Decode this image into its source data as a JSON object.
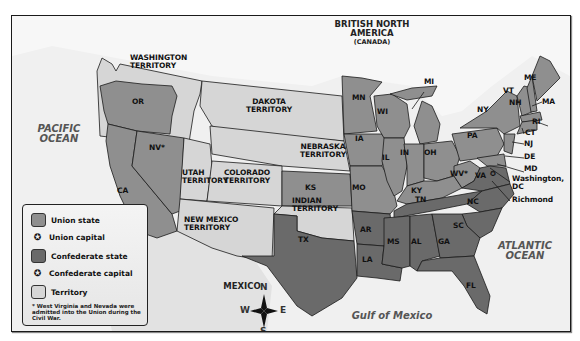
{
  "colors": {
    "union_state": "#8f8f8f",
    "confederate_state": "#6a6a6a",
    "territory": "#d6d6d6",
    "ocean": "#f0f0f0",
    "land_foreign": "#e4e4e4",
    "border": "#1a1a1a"
  },
  "regions": {
    "british_north_america": "BRITISH NORTH AMERICA",
    "canada": "(CANADA)",
    "pacific_ocean_1": "PACIFIC",
    "pacific_ocean_2": "OCEAN",
    "atlantic_ocean_1": "ATLANTIC",
    "atlantic_ocean_2": "OCEAN",
    "gulf_of_mexico": "Gulf of Mexico",
    "mexico": "MEXICO"
  },
  "territories": {
    "washington": [
      "WASHINGTON",
      "TERRITORY"
    ],
    "dakota": [
      "DAKOTA",
      "TERRITORY"
    ],
    "nebraska": [
      "NEBRASKA",
      "TERRITORY"
    ],
    "utah": [
      "UTAH",
      "TERRITORY"
    ],
    "colorado": [
      "COLORADO",
      "TERRITORY"
    ],
    "new_mexico": [
      "NEW MEXICO",
      "TERRITORY"
    ],
    "indian": [
      "INDIAN",
      "TERRITORY"
    ]
  },
  "union_states": [
    "OR",
    "CA",
    "NV*",
    "MN",
    "IA",
    "KS",
    "MO",
    "WI",
    "MI",
    "IL",
    "IN",
    "OH",
    "KY",
    "WV*",
    "PA",
    "NY",
    "VT",
    "NH",
    "ME",
    "MA",
    "RI",
    "CT",
    "NJ",
    "DE",
    "MD"
  ],
  "confederate_states": [
    "TX",
    "AR",
    "LA",
    "MS",
    "AL",
    "TN",
    "GA",
    "SC",
    "NC",
    "VA",
    "FL"
  ],
  "state_labels": {
    "OR": "OR",
    "CA": "CA",
    "NV": "NV*",
    "MN": "MN",
    "IA": "IA",
    "KS": "KS",
    "MO": "MO",
    "WI": "WI",
    "MI": "MI",
    "IL": "IL",
    "IN": "IN",
    "OH": "OH",
    "KY": "KY",
    "WV": "WV*",
    "PA": "PA",
    "NY": "NY",
    "VT": "VT",
    "NH": "NH",
    "ME": "ME",
    "MA": "MA",
    "RI": "RI",
    "CT": "CT",
    "NJ": "NJ",
    "DE": "DE",
    "MD": "MD",
    "TX": "TX",
    "AR": "AR",
    "LA": "LA",
    "MS": "MS",
    "AL": "AL",
    "TN": "TN",
    "GA": "GA",
    "SC": "SC",
    "NC": "NC",
    "VA": "VA",
    "FL": "FL"
  },
  "capitals": {
    "washington_1": "Washington,",
    "washington_2": "DC",
    "richmond": "Richmond"
  },
  "legend": {
    "items": [
      {
        "label": "Union state",
        "type": "swatch",
        "color": "#8f8f8f"
      },
      {
        "label": "Union capital",
        "type": "capital"
      },
      {
        "label": "Confederate state",
        "type": "swatch",
        "color": "#6a6a6a"
      },
      {
        "label": "Confederate capital",
        "type": "capital"
      },
      {
        "label": "Territory",
        "type": "swatch",
        "color": "#d6d6d6"
      }
    ],
    "note": "* West Virginia and Nevada were admitted into the Union during the Civil War.",
    "capital_symbol": "✪"
  },
  "compass": {
    "n": "N",
    "s": "S",
    "e": "E",
    "w": "W"
  }
}
